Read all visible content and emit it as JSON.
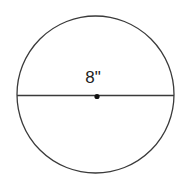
{
  "diagram": {
    "shape": "circle",
    "diameter_label": "8\"",
    "colors": {
      "stroke": "#3a3a3a",
      "background": "#ffffff",
      "text": "#222222"
    }
  }
}
